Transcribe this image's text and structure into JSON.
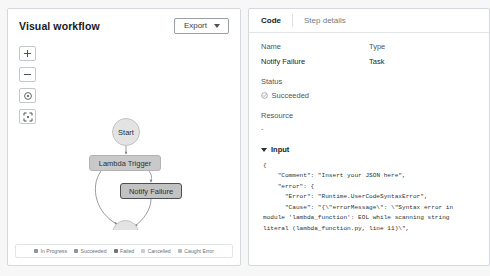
{
  "left": {
    "title": "Visual workflow",
    "export_button": "Export",
    "zoom_tools": [
      {
        "name": "zoom-in-button",
        "glyph": "+"
      },
      {
        "name": "zoom-out-button",
        "glyph": "−"
      },
      {
        "name": "center-view-button",
        "glyph": "◎"
      },
      {
        "name": "fullscreen-button",
        "glyph": "⛶"
      }
    ],
    "graph": {
      "nodes": [
        {
          "id": "start",
          "label": "Start",
          "shape": "circle",
          "state": "default"
        },
        {
          "id": "lambda",
          "label": "Lambda Trigger",
          "shape": "rect",
          "state": "default"
        },
        {
          "id": "notify",
          "label": "Notify Failure",
          "shape": "rect",
          "state": "selected"
        },
        {
          "id": "end",
          "label": "End",
          "shape": "circle",
          "state": "default"
        }
      ],
      "edges": [
        {
          "from": "start",
          "to": "lambda"
        },
        {
          "from": "lambda",
          "to": "notify"
        },
        {
          "from": "lambda",
          "to": "end"
        },
        {
          "from": "notify",
          "to": "end"
        }
      ]
    },
    "legend": [
      {
        "label": "In Progress",
        "color": "#8c949c"
      },
      {
        "label": "Succeeded",
        "color": "#8c949c"
      },
      {
        "label": "Failed",
        "color": "#6c747c"
      },
      {
        "label": "Cancelled",
        "color": "#c8ccd0"
      },
      {
        "label": "Caught Error",
        "color": "#b4babf"
      }
    ]
  },
  "right": {
    "tabs": [
      {
        "label": "Code",
        "active": true
      },
      {
        "label": "Step details",
        "active": false
      }
    ],
    "fields": {
      "name_label": "Name",
      "name_value": "Notify Failure",
      "type_label": "Type",
      "type_value": "Task",
      "status_label": "Status",
      "status_value": "Succeeded",
      "resource_label": "Resource",
      "resource_value": "-"
    },
    "input_section": {
      "title": "Input",
      "expanded": true,
      "code": "{\n    \"Comment\": \"Insert your JSON here\",\n    \"error\": {\n      \"Error\": \"Runtime.UserCodeSyntaxError\",\n      \"Cause\": \"{\\\"errorMessage\\\": \\\"Syntax error in module 'lambda_function': EOL while scanning string literal (lambda_function.py, line 11)\\\",\n\\\"errorType\\\": \\\"Runtime.UserCodeSyntaxError\\\","
    }
  },
  "colors": {
    "page_bg": "#f7f7f8",
    "panel_bg": "#ffffff",
    "border": "#d5d9dd",
    "node_fill": "#c9c9c9",
    "node_selected_border": "#4a4f55",
    "accent_underline": "#3f4a55"
  }
}
